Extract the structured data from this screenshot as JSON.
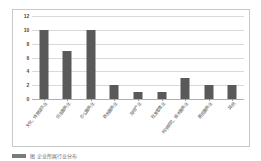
{
  "chart_data": {
    "type": "bar",
    "title": "",
    "xlabel": "",
    "ylabel": "",
    "ylim": [
      0,
      12
    ],
    "ytick_step": 2,
    "grid": true,
    "legend": "none",
    "bar_color": "#595959",
    "gridline_color": "#d9d9d9",
    "frame_color": "#c8c8c8",
    "categories": [
      "文化、体育娱乐业",
      "信息服务业",
      "办公服务业",
      "商务服务业",
      "房地产业",
      "批发零售业",
      "科学研究、技术服务业",
      "居民服务业",
      "其他"
    ],
    "values": [
      10,
      7,
      10,
      2,
      1,
      1,
      3,
      2,
      2
    ],
    "ytick_labels": [
      "0",
      "2",
      "4",
      "6",
      "8",
      "10",
      "12"
    ]
  },
  "caption": {
    "marker": "",
    "text": "图 企业所属行业分布"
  }
}
